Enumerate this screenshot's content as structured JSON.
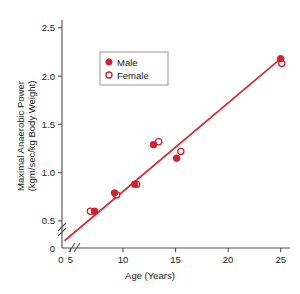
{
  "chart_data": {
    "type": "scatter",
    "title": "",
    "xlabel": "Age (Years)",
    "ylabel": "Maximal Anaerobic Power (kgm/sec/kg Body Weight)",
    "ylabel_line1": "Maximal Anaerobic Power",
    "ylabel_line2": "(kgm/sec/kg Body Weight)",
    "xlim": [
      4.2,
      25.6
    ],
    "ylim": [
      0.22,
      2.56
    ],
    "xticks": [
      5,
      10,
      15,
      20,
      25
    ],
    "xtick_labels": [
      "5",
      "10",
      "15",
      "20",
      "25"
    ],
    "yticks": [
      0.5,
      1.0,
      1.5,
      2.0,
      2.5
    ],
    "ytick_labels": [
      "0.5",
      "1.0",
      "1.5",
      "2.0",
      "2.5"
    ],
    "origin_label": "0",
    "origin_label_y": "0",
    "axis_break": true,
    "grid": false,
    "legend_position": "upper-left-inside",
    "accent_color": "#d42b34",
    "marker_fill_color": "#cf2230",
    "marker_edge_color": "#cf2230",
    "axis_color": "#4d4d4d",
    "text_color": "#1a1a1a",
    "series": [
      {
        "name": "Male",
        "marker": "filled-circle",
        "points": [
          {
            "x": 7.3,
            "y": 0.6
          },
          {
            "x": 9.2,
            "y": 0.79
          },
          {
            "x": 11.1,
            "y": 0.88
          },
          {
            "x": 12.9,
            "y": 1.29
          },
          {
            "x": 15.1,
            "y": 1.15
          },
          {
            "x": 25.0,
            "y": 2.18
          }
        ]
      },
      {
        "name": "Female",
        "marker": "open-circle",
        "points": [
          {
            "x": 6.9,
            "y": 0.6
          },
          {
            "x": 9.4,
            "y": 0.77
          },
          {
            "x": 11.3,
            "y": 0.88
          },
          {
            "x": 13.4,
            "y": 1.32
          },
          {
            "x": 15.5,
            "y": 1.22
          },
          {
            "x": 25.1,
            "y": 2.13
          }
        ]
      }
    ],
    "trendline": {
      "name": "regression-line",
      "x_start": 4.5,
      "y_start": 0.3,
      "x_end": 25.0,
      "y_end": 2.18
    }
  },
  "legend": {
    "entries": [
      {
        "label": "Male",
        "marker": "filled-circle"
      },
      {
        "label": "Female",
        "marker": "open-circle"
      }
    ]
  }
}
